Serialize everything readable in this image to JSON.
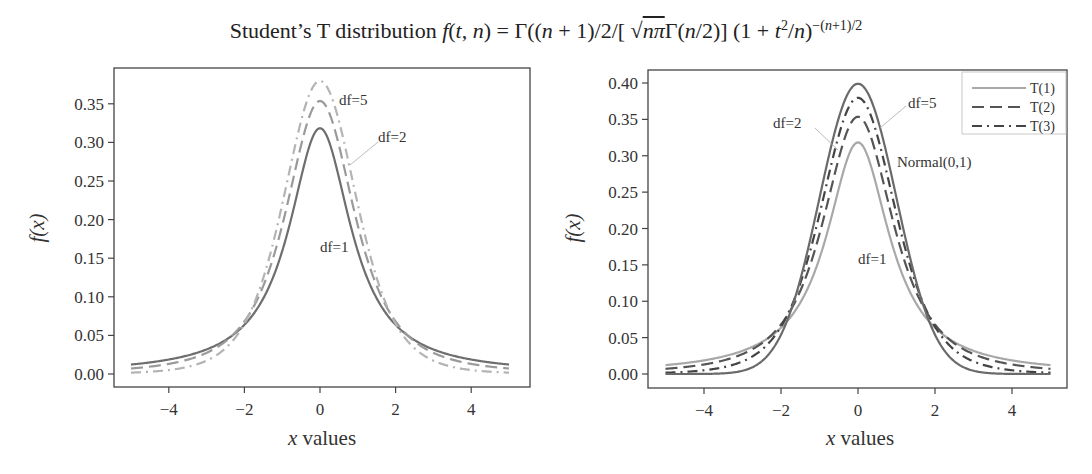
{
  "title": {
    "prefix": "Student’s T distribution ",
    "formula_html": "<span class=\"it\">f</span>(<span class=\"it\">t</span>, <span class=\"it\">n</span>) = Γ((<span class=\"it\">n</span> + 1)/2/[ √<span style=\"text-decoration:overline\"><span class=\"it\">nπ</span></span>Γ(<span class=\"it\">n</span>/2)] (1 + <span class=\"it\">t</span><sup>2</sup>/<span class=\"it\">n</span>)<sup>−(<span class=\"it\">n</span>+1)/2</sup>"
  },
  "chart_data": [
    {
      "type": "line",
      "title": "Student’s T distribution f(t, n) = Γ((n + 1)/2/[√(nπ)Γ(n/2)] (1 + t²/n)^−(n+1)/2",
      "xlabel": "x values",
      "ylabel": "f(x)",
      "xlim": [
        -5.45,
        5.5
      ],
      "ylim": [
        -0.017,
        0.397
      ],
      "xticks": [
        -4,
        -2,
        0,
        2,
        4
      ],
      "yticks": [
        "0.00",
        "0.05",
        "0.10",
        "0.15",
        "0.20",
        "0.25",
        "0.30",
        "0.35"
      ],
      "grid": false,
      "legend": null,
      "x_range_plotted": [
        -5,
        5
      ],
      "series": [
        {
          "name": "df=1",
          "df": 1,
          "style": "solid",
          "color": "#6e6e6e",
          "peak": 0.318
        },
        {
          "name": "df=2",
          "df": 2,
          "style": "dashed",
          "color": "#9a9a9a",
          "peak": 0.354
        },
        {
          "name": "df=5",
          "df": 5,
          "style": "dashdot",
          "color": "#b4b4b4",
          "peak": 0.38
        }
      ],
      "annotations": [
        {
          "text": "df=5",
          "x": 0.55,
          "y": 0.355
        },
        {
          "text": "df=2",
          "x": 1.6,
          "y": 0.305,
          "arrow_to": [
            0.8,
            0.265
          ]
        },
        {
          "text": "df=1",
          "x": 0.25,
          "y": 0.19
        }
      ]
    },
    {
      "type": "line",
      "title": "",
      "xlabel": "x values",
      "ylabel": "f(x)",
      "xlim": [
        -5.45,
        5.45
      ],
      "ylim": [
        -0.019,
        0.418
      ],
      "xticks": [
        -4,
        -2,
        0,
        2,
        4
      ],
      "yticks": [
        "0.00",
        "0.05",
        "0.10",
        "0.15",
        "0.20",
        "0.25",
        "0.30",
        "0.35",
        "0.40"
      ],
      "grid": false,
      "legend": {
        "position": "upper right",
        "entries": [
          "T(1)",
          "T(2)",
          "T(3)"
        ]
      },
      "x_range_plotted": [
        -5,
        5
      ],
      "series": [
        {
          "name": "T(1)",
          "df": 1,
          "style": "solid",
          "color": "#a8a8a8",
          "peak": 0.318
        },
        {
          "name": "T(2)",
          "df": 2,
          "style": "dashed",
          "color": "#555555",
          "peak": 0.354
        },
        {
          "name": "T(3)",
          "df": 5,
          "style": "dashdot",
          "color": "#444444",
          "peak": 0.38
        },
        {
          "name": "Normal(0,1)",
          "df": "normal",
          "style": "solid",
          "color": "#6a6a6a",
          "peak": 0.399
        }
      ],
      "annotations": [
        {
          "text": "df=2",
          "x": -1.2,
          "y": 0.335,
          "arrow_to": [
            -0.6,
            0.29
          ]
        },
        {
          "text": "df=5",
          "x": 1.5,
          "y": 0.355,
          "arrow_to": [
            0.65,
            0.31
          ]
        },
        {
          "text": "Normal(0,1)",
          "x": 2.2,
          "y": 0.27
        },
        {
          "text": "df=1",
          "x": 0.25,
          "y": 0.085
        }
      ]
    }
  ],
  "left": {
    "ylabel": "f(x)",
    "xlabel_var": "x",
    "xlabel_rest": " values",
    "xticks": [
      "−4",
      "−2",
      "0",
      "2",
      "4"
    ],
    "yticks": [
      "0.00",
      "0.05",
      "0.10",
      "0.15",
      "0.20",
      "0.25",
      "0.30",
      "0.35"
    ],
    "labels": {
      "df5": "df=5",
      "df2": "df=2",
      "df1": "df=1"
    }
  },
  "right": {
    "ylabel": "f(x)",
    "xlabel_var": "x",
    "xlabel_rest": " values",
    "xticks": [
      "−4",
      "−2",
      "0",
      "2",
      "4"
    ],
    "yticks": [
      "0.00",
      "0.05",
      "0.10",
      "0.15",
      "0.20",
      "0.25",
      "0.30",
      "0.35",
      "0.40"
    ],
    "labels": {
      "df2": "df=2",
      "df5": "df=5",
      "normal": "Normal(0,1)",
      "df1": "df=1"
    },
    "legend": [
      "T(1)",
      "T(2)",
      "T(3)"
    ]
  }
}
